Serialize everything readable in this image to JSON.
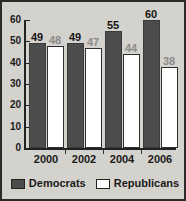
{
  "chart_data": {
    "type": "bar",
    "title": "",
    "subtitle": "",
    "xlabel": "",
    "ylabel": "",
    "categories": [
      "2000",
      "2002",
      "2004",
      "2006"
    ],
    "series": [
      {
        "name": "Democrats",
        "color": "#4c4c4c",
        "values": [
          49,
          49,
          55,
          60
        ]
      },
      {
        "name": "Republicans",
        "color": "#ffffff",
        "values": [
          48,
          47,
          44,
          38
        ]
      }
    ],
    "ylim": [
      0,
      60
    ],
    "yticks": [
      0,
      10,
      20,
      30,
      40,
      50,
      60
    ],
    "ytick_labels": [
      "0",
      "10",
      "20",
      "30",
      "40",
      "50",
      "60"
    ],
    "grid": false,
    "legend_position": "bottom",
    "data_labels_shown": true
  },
  "legend": {
    "entries": [
      {
        "label": "Democrats",
        "swatch_color": "#4c4c4c"
      },
      {
        "label": "Republicans",
        "swatch_color": "#ffffff"
      }
    ]
  },
  "figure": {
    "background_color": "#d4d2cd",
    "border_color": "#2b2b2b",
    "axis_color": "#222222"
  }
}
